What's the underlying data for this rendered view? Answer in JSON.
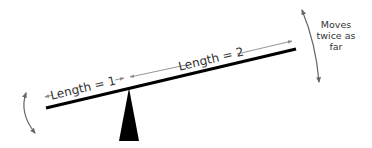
{
  "diagram": {
    "labels": {
      "length_short": "Length = 1",
      "length_long": "Length = 2",
      "note_line1": "Moves",
      "note_line2": "twice as",
      "note_line3": "far"
    },
    "elements": {
      "lever": {
        "x1": 46,
        "y1": 108,
        "x2": 296,
        "y2": 49,
        "color": "#000000",
        "stroke_width": 3.2
      },
      "fulcrum": {
        "apex_x": 129,
        "apex_y": 88,
        "base_left_x": 119,
        "base_right_x": 139,
        "base_y": 141,
        "color": "#000000"
      },
      "short_arm_ratio": 1,
      "long_arm_ratio": 2
    },
    "colors": {
      "lever": "#000000",
      "fulcrum": "#000000",
      "arrow": "#888888",
      "arc_arrow": "#666666",
      "text": "#333333"
    }
  }
}
